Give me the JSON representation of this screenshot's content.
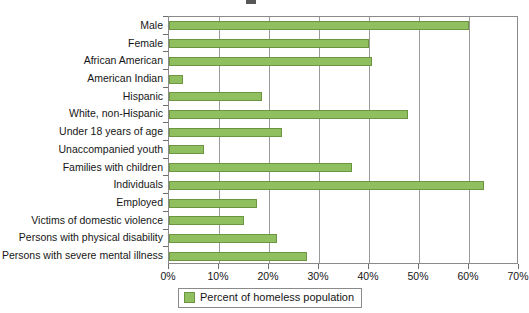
{
  "chart_data": {
    "type": "bar",
    "orientation": "horizontal",
    "title": "",
    "xlabel": "",
    "ylabel": "",
    "xlim": [
      0,
      70
    ],
    "xtick_labels": [
      "0%",
      "10%",
      "20%",
      "30%",
      "40%",
      "50%",
      "60%",
      "70%"
    ],
    "xtick_values": [
      0,
      10,
      20,
      30,
      40,
      50,
      60,
      70
    ],
    "grid": true,
    "grid_axis": "x",
    "legend": {
      "position": "bottom",
      "entries": [
        {
          "label": "Percent of homeless population",
          "color": "#8fbf5e"
        }
      ]
    },
    "series_name": "Percent of homeless population",
    "bar_color": "#8fbf5e",
    "bar_border_color": "#6d9440",
    "categories": [
      "Male",
      "Female",
      "African American",
      "American Indian",
      "Hispanic",
      "White, non-Hispanic",
      "Under 18 years of age",
      "Unaccompanied youth",
      "Families with children",
      "Individuals",
      "Employed",
      "Victims of domestic violence",
      "Persons with physical disability",
      "Persons with severe mental illness"
    ],
    "values": [
      60,
      40,
      40.5,
      2.8,
      18.5,
      47.8,
      22.5,
      7,
      36.5,
      63,
      17.5,
      15,
      21.5,
      27.5
    ]
  }
}
